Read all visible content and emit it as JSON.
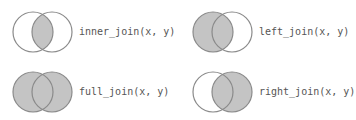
{
  "colors": {
    "fill": "#c4c4c4",
    "stroke": "#8a8a8a",
    "background": "#ffffff",
    "text": "#555555"
  },
  "joins": [
    {
      "name": "inner_join",
      "label": "inner_join(x, y)",
      "shaded": "intersection"
    },
    {
      "name": "left_join",
      "label": "left_join(x, y)",
      "shaded": "left"
    },
    {
      "name": "full_join",
      "label": "full_join(x, y)",
      "shaded": "both"
    },
    {
      "name": "right_join",
      "label": "right_join(x, y)",
      "shaded": "right"
    }
  ]
}
